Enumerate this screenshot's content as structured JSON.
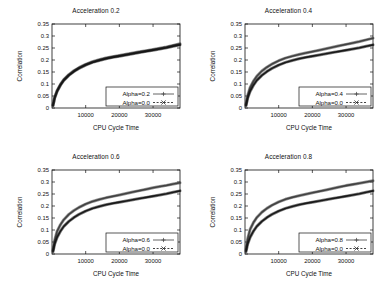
{
  "figure": {
    "background": "#ffffff",
    "panel_count": 4,
    "layout": "2x2 grid"
  },
  "axes": {
    "xlabel": "CPU Cycle Time",
    "ylabel": "Correlation",
    "x_ticks": [
      "10000",
      "20000",
      "30000"
    ],
    "x_tick_values": [
      10000,
      20000,
      30000
    ],
    "y_ticks": [
      "0",
      "0.05",
      "0.1",
      "0.15",
      "0.2",
      "0.25",
      "0.3",
      "0.35"
    ],
    "y_tick_values": [
      0,
      0.05,
      0.1,
      0.15,
      0.2,
      0.25,
      0.3,
      0.35
    ],
    "xlim": [
      0,
      38000
    ],
    "ylim": [
      0,
      0.35
    ],
    "grid": false,
    "tick_direction": "in"
  },
  "colors": {
    "axis": "#111111",
    "series_alpha": "#3d3d3d",
    "series_baseline": "#141414",
    "background": "#ffffff",
    "legend_border": "#111111"
  },
  "chart_data": [
    {
      "type": "line",
      "title": "Acceleration 0.2",
      "xlabel": "CPU Cycle Time",
      "ylabel": "Correlation",
      "xlim": [
        0,
        38000
      ],
      "ylim": [
        0,
        0.35
      ],
      "grid": false,
      "legend_position": "bottom-right",
      "x": [
        300,
        800,
        1500,
        2500,
        3500,
        5000,
        6500,
        8000,
        10000,
        12000,
        14000,
        16000,
        18000,
        20000,
        22000,
        24000,
        26000,
        28000,
        30000,
        32000,
        34000,
        36000,
        38000
      ],
      "series": [
        {
          "name": "Alpha=0.2",
          "style": "solid",
          "marker": "+",
          "values": [
            0.012,
            0.045,
            0.072,
            0.098,
            0.118,
            0.139,
            0.155,
            0.168,
            0.182,
            0.193,
            0.201,
            0.208,
            0.214,
            0.219,
            0.224,
            0.229,
            0.234,
            0.239,
            0.244,
            0.249,
            0.254,
            0.261,
            0.268
          ]
        },
        {
          "name": "Alpha=0.0",
          "style": "dashed",
          "marker": "x",
          "values": [
            0.01,
            0.042,
            0.069,
            0.095,
            0.115,
            0.136,
            0.152,
            0.165,
            0.179,
            0.19,
            0.198,
            0.205,
            0.211,
            0.216,
            0.221,
            0.226,
            0.231,
            0.236,
            0.241,
            0.246,
            0.251,
            0.257,
            0.263
          ]
        }
      ]
    },
    {
      "type": "line",
      "title": "Acceleration 0.4",
      "xlabel": "CPU Cycle Time",
      "ylabel": "Correlation",
      "xlim": [
        0,
        38000
      ],
      "ylim": [
        0,
        0.35
      ],
      "grid": false,
      "legend_position": "bottom-right",
      "x": [
        300,
        800,
        1500,
        2500,
        3500,
        5000,
        6500,
        8000,
        10000,
        12000,
        14000,
        16000,
        18000,
        20000,
        22000,
        24000,
        26000,
        28000,
        30000,
        32000,
        34000,
        36000,
        38000
      ],
      "series": [
        {
          "name": "Alpha=0.4",
          "style": "solid",
          "marker": "+",
          "values": [
            0.014,
            0.052,
            0.085,
            0.112,
            0.132,
            0.154,
            0.17,
            0.183,
            0.197,
            0.208,
            0.216,
            0.223,
            0.229,
            0.235,
            0.241,
            0.247,
            0.253,
            0.259,
            0.265,
            0.271,
            0.277,
            0.284,
            0.291
          ]
        },
        {
          "name": "Alpha=0.0",
          "style": "dashed",
          "marker": "x",
          "values": [
            0.01,
            0.042,
            0.069,
            0.095,
            0.115,
            0.136,
            0.152,
            0.165,
            0.179,
            0.19,
            0.198,
            0.205,
            0.211,
            0.216,
            0.221,
            0.226,
            0.231,
            0.236,
            0.241,
            0.246,
            0.251,
            0.257,
            0.263
          ]
        }
      ]
    },
    {
      "type": "line",
      "title": "Acceleration 0.6",
      "xlabel": "CPU Cycle Time",
      "ylabel": "Correlation",
      "xlim": [
        0,
        38000
      ],
      "ylim": [
        0,
        0.35
      ],
      "grid": false,
      "legend_position": "bottom-right",
      "x": [
        300,
        800,
        1500,
        2500,
        3500,
        5000,
        6500,
        8000,
        10000,
        12000,
        14000,
        16000,
        18000,
        20000,
        22000,
        24000,
        26000,
        28000,
        30000,
        32000,
        34000,
        36000,
        38000
      ],
      "series": [
        {
          "name": "Alpha=0.6",
          "style": "solid",
          "marker": "+",
          "values": [
            0.016,
            0.058,
            0.094,
            0.122,
            0.143,
            0.165,
            0.181,
            0.194,
            0.208,
            0.219,
            0.227,
            0.234,
            0.24,
            0.246,
            0.252,
            0.258,
            0.264,
            0.27,
            0.276,
            0.281,
            0.286,
            0.292,
            0.297
          ]
        },
        {
          "name": "Alpha=0.0",
          "style": "dashed",
          "marker": "x",
          "values": [
            0.01,
            0.042,
            0.069,
            0.095,
            0.115,
            0.136,
            0.152,
            0.165,
            0.179,
            0.19,
            0.198,
            0.205,
            0.211,
            0.216,
            0.221,
            0.226,
            0.231,
            0.236,
            0.241,
            0.246,
            0.251,
            0.257,
            0.263
          ]
        }
      ]
    },
    {
      "type": "line",
      "title": "Acceleration 0.8",
      "xlabel": "CPU Cycle Time",
      "ylabel": "Correlation",
      "xlim": [
        0,
        38000
      ],
      "ylim": [
        0,
        0.35
      ],
      "grid": false,
      "legend_position": "bottom-right",
      "x": [
        300,
        800,
        1500,
        2500,
        3500,
        5000,
        6500,
        8000,
        10000,
        12000,
        14000,
        16000,
        18000,
        20000,
        22000,
        24000,
        26000,
        28000,
        30000,
        32000,
        34000,
        36000,
        38000
      ],
      "series": [
        {
          "name": "Alpha=0.8",
          "style": "solid",
          "marker": "+",
          "values": [
            0.018,
            0.064,
            0.102,
            0.131,
            0.152,
            0.174,
            0.19,
            0.203,
            0.217,
            0.228,
            0.236,
            0.243,
            0.249,
            0.255,
            0.261,
            0.267,
            0.273,
            0.279,
            0.285,
            0.29,
            0.295,
            0.3,
            0.305
          ]
        },
        {
          "name": "Alpha=0.0",
          "style": "dashed",
          "marker": "x",
          "values": [
            0.01,
            0.042,
            0.069,
            0.095,
            0.115,
            0.136,
            0.152,
            0.165,
            0.179,
            0.19,
            0.198,
            0.205,
            0.211,
            0.216,
            0.221,
            0.226,
            0.231,
            0.236,
            0.241,
            0.246,
            0.251,
            0.257,
            0.263
          ]
        }
      ]
    }
  ]
}
